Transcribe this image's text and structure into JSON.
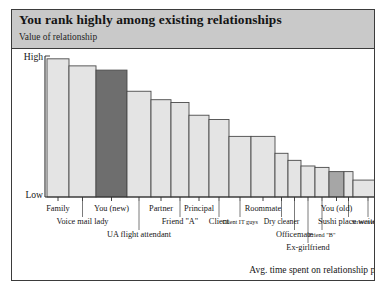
{
  "header": {
    "title": "You rank highly among existing relationships",
    "subtitle": "Value of relationship"
  },
  "axes": {
    "y_high_label": "High",
    "y_low_label": "Low",
    "x_caption": "Avg. time spent on relationship per week"
  },
  "colors": {
    "header_background": "#c9c9c9",
    "frame": "#3b3b3b",
    "bar_default": "#e4e4e4",
    "bar_highlight_new": "#6e6e6e",
    "bar_highlight_old": "#a6a6a6",
    "bar_outline": "#4a4a4a",
    "text": "#161616",
    "plot_background": "#ffffff"
  },
  "chart_data": {
    "type": "bar",
    "title": "You rank highly among existing relationships",
    "subtitle": "Value of relationship",
    "xlabel": "Avg. time spent on relationship per week",
    "ylabel": "Value of relationship",
    "ylim": [
      0,
      100
    ],
    "ytick_labels": [
      "Low",
      "High"
    ],
    "grid": false,
    "legend": false,
    "categories": [
      "Family",
      "Voice mail lady",
      "You (new)",
      "UA flight attendant",
      "Partner",
      "Friend \"A\"",
      "Principal",
      "Client",
      "Client IT guys",
      "Roommate",
      "Dry cleaner",
      "Officemate",
      "Ex-girlfriend",
      "Friend \"B\"",
      "You (old)",
      "Sushi place waiter",
      "Street vendor"
    ],
    "values": [
      98,
      93,
      90,
      75,
      69,
      67,
      58,
      55,
      43,
      43,
      31,
      26,
      22,
      21,
      18,
      18,
      12
    ],
    "bar_widths": [
      22,
      27,
      31,
      24,
      20,
      18,
      20,
      20,
      22,
      24,
      13,
      13,
      14,
      14,
      15,
      9,
      30
    ],
    "highlights": {
      "You (new)": "#6e6e6e",
      "You (old)": "#a6a6a6"
    }
  },
  "labels": [
    {
      "text": "Family",
      "tier": 0
    },
    {
      "text": "Voice mail lady",
      "tier": 1
    },
    {
      "text": "You (new)",
      "tier": 0
    },
    {
      "text": "UA flight attendant",
      "tier": 2
    },
    {
      "text": "Partner",
      "tier": 0
    },
    {
      "text": "Friend \"A\"",
      "tier": 1
    },
    {
      "text": "Principal",
      "tier": 0
    },
    {
      "text": "Client",
      "tier": 1
    },
    {
      "text": "Client IT guys",
      "tier": 1
    },
    {
      "text": "Roommate",
      "tier": 0
    },
    {
      "text": "Dry cleaner",
      "tier": 1
    },
    {
      "text": "Officemate",
      "tier": 2
    },
    {
      "text": "Ex-girlfriend",
      "tier": 3
    },
    {
      "text": "Friend \"B\"",
      "tier": 2
    },
    {
      "text": "You (old)",
      "tier": 0
    },
    {
      "text": "Sushi place waiter",
      "tier": 1
    },
    {
      "text": "Street vendor",
      "tier": 1
    }
  ]
}
